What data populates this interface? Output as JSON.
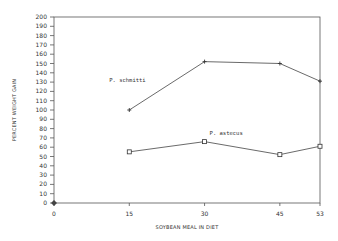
{
  "chart_data": {
    "type": "line",
    "title": "",
    "xlabel": "SOYBEAN MEAL IN DIET",
    "ylabel": "PERCENT WEIGHT GAIN",
    "x": [
      0,
      15,
      30,
      45,
      53
    ],
    "x_tick_labels": [
      "0",
      "15",
      "30",
      "45",
      "53"
    ],
    "ylim": [
      0,
      200
    ],
    "y_ticks": [
      0,
      10,
      20,
      30,
      40,
      50,
      60,
      70,
      80,
      90,
      100,
      110,
      120,
      130,
      140,
      150,
      160,
      170,
      180,
      190,
      200
    ],
    "grid": false,
    "series": [
      {
        "name": "P. schmitti",
        "marker": "plus",
        "x": [
          15,
          30,
          45,
          53
        ],
        "values": [
          100,
          152,
          150,
          131
        ]
      },
      {
        "name": "P. astecus",
        "marker": "open-square",
        "x": [
          15,
          30,
          45,
          53
        ],
        "values": [
          55,
          66,
          52,
          61
        ]
      }
    ],
    "origin_marker": {
      "x": 0,
      "y": 0,
      "marker": "diamond"
    },
    "annotations": [
      {
        "text": "P. schmitti",
        "near_x": 11,
        "near_y": 130
      },
      {
        "text": "P. astecus",
        "near_x": 31,
        "near_y": 73
      }
    ]
  }
}
